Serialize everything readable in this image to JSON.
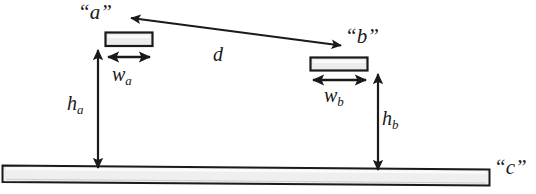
{
  "diagram": {
    "type": "technical-line-diagram",
    "background_color": "#ffffff",
    "stroke_color": "#1a1a1a",
    "fill_color": "#e8e8e8",
    "labels": {
      "object_a": "“a”",
      "object_b": "“b”",
      "object_c": "“c”",
      "distance_d": "d",
      "width_a_base": "w",
      "width_a_sub": "a",
      "width_b_base": "w",
      "width_b_sub": "b",
      "height_a_base": "h",
      "height_a_sub": "a",
      "height_b_base": "h",
      "height_b_sub": "b"
    },
    "shapes": {
      "plate_a": {
        "x": 105,
        "y": 32,
        "width": 48,
        "height": 14
      },
      "plate_b": {
        "x": 310,
        "y": 57,
        "width": 58,
        "height": 14
      },
      "ground_c": {
        "left_x": 2,
        "right_x": 490,
        "left_top_y": 165,
        "right_top_y": 169,
        "thickness": 17
      }
    },
    "dimension_lines": {
      "d": {
        "x1": 342,
        "y1": 45,
        "x2": 131,
        "y2": 18,
        "arrows": "both"
      },
      "w_a": {
        "x1": 107,
        "y1": 57,
        "x2": 151,
        "y2": 57,
        "arrows": "both"
      },
      "w_b": {
        "x1": 312,
        "y1": 80,
        "x2": 367,
        "y2": 80,
        "arrows": "both"
      },
      "h_a": {
        "x": 98,
        "y1": 49,
        "y2": 169,
        "arrows": "both"
      },
      "h_b": {
        "x": 378,
        "y1": 73,
        "y2": 171,
        "arrows": "both"
      }
    }
  }
}
